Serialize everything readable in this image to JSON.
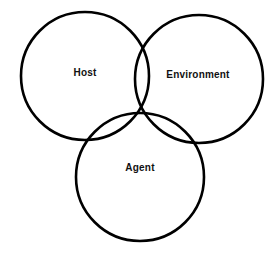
{
  "diagram": {
    "type": "venn",
    "title": "",
    "background_color": "#ffffff",
    "stroke_color": "#000000",
    "stroke_width": 2.6,
    "label_color": "#111111",
    "sets": [
      {
        "id": "host",
        "label": "Host",
        "cx": 85,
        "cy": 76,
        "r": 64,
        "label_x": 85,
        "label_y": 73
      },
      {
        "id": "environment",
        "label": "Environment",
        "cx": 199,
        "cy": 79,
        "r": 64,
        "label_x": 198,
        "label_y": 75
      },
      {
        "id": "agent",
        "label": "Agent",
        "cx": 140,
        "cy": 177,
        "r": 64,
        "label_x": 140,
        "label_y": 168
      }
    ]
  }
}
